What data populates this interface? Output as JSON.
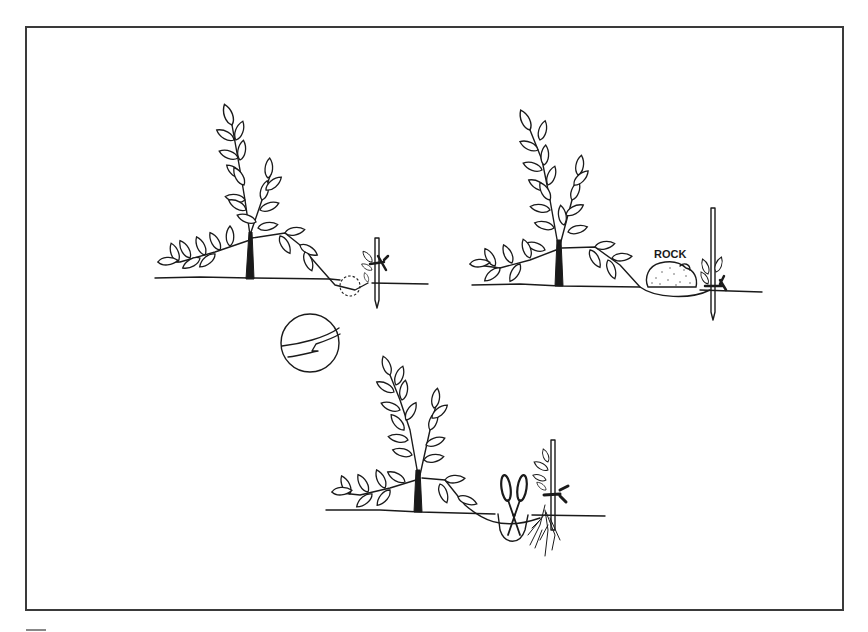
{
  "figure": {
    "border_color": "#3a3a3a",
    "ink_color": "#1a1a1a",
    "panels": [
      {
        "id": "step-1",
        "caption": "",
        "elements": [
          "shrub",
          "bent-branch",
          "stake",
          "tie",
          "dashed-circle-detail"
        ]
      },
      {
        "id": "detail",
        "caption": "",
        "elements": [
          "magnified-circle",
          "notch-cut"
        ]
      },
      {
        "id": "step-2",
        "label": "ROCK",
        "elements": [
          "shrub",
          "bent-branch",
          "rock",
          "stake",
          "tie"
        ]
      },
      {
        "id": "step-3",
        "caption": "",
        "elements": [
          "shrub",
          "pruning-shears",
          "rooted-layer",
          "stake",
          "tie"
        ]
      }
    ],
    "rock_label": "ROCK"
  }
}
